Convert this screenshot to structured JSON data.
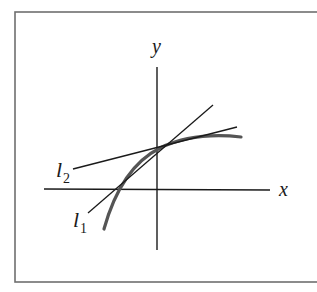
{
  "figure": {
    "frame": {
      "x1": 15,
      "y1": 12,
      "x2": 322,
      "y2": 282,
      "color": "#6f6f6f"
    },
    "axes": {
      "x_axis": {
        "x1": 44,
        "y1": 189,
        "x2": 270,
        "y2": 190,
        "label": "x",
        "label_x": 279,
        "label_y": 196
      },
      "y_axis": {
        "x1": 157,
        "y1": 67,
        "x2": 157,
        "y2": 250,
        "label": "y",
        "label_x": 152,
        "label_y": 53
      }
    },
    "lines": [
      {
        "name": "l1",
        "label": "l",
        "subscript": "1",
        "x1": 88,
        "y1": 213,
        "x2": 213,
        "y2": 105,
        "label_x": 73,
        "label_y": 227,
        "sub_x": 80,
        "sub_y": 233
      },
      {
        "name": "l2",
        "label": "l",
        "subscript": "2",
        "x1": 73,
        "y1": 169,
        "x2": 237,
        "y2": 127,
        "label_x": 56,
        "label_y": 177,
        "sub_x": 63,
        "sub_y": 183
      }
    ],
    "curve": {
      "name": "f",
      "path": "M 104 229 C 116 186, 136 160, 160 148 C 185 136, 214 134, 241 137",
      "color": "#555555",
      "stroke_width": 3.2
    },
    "colors": {
      "ink": "#1a1a1a",
      "curve": "#555555",
      "frame": "#6f6f6f"
    }
  }
}
